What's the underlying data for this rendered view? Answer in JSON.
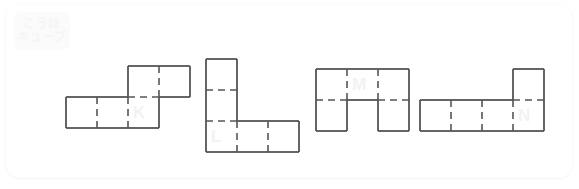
{
  "page": {
    "background_color": "#ffffff",
    "card_color": "#ffffff",
    "stroke_color": "#555555",
    "label_color": "#f2f2f3"
  },
  "logo": {
    "name": "kouho-cube-logo",
    "line1": "こうほ",
    "line2": "キューブ",
    "background": "#fbfbfc",
    "text_color": "#f4f5f6"
  },
  "nets": [
    {
      "label": "K",
      "description": "L-shaped pentomino net: bottom row of three squares with two squares above the rightmost two columns",
      "cell_size": 31,
      "origin_x": 66,
      "origin_y": 66,
      "cells": [
        {
          "col": 0,
          "row": 1
        },
        {
          "col": 1,
          "row": 1
        },
        {
          "col": 2,
          "row": 1
        },
        {
          "col": 2,
          "row": 0
        },
        {
          "col": 3,
          "row": 0
        }
      ],
      "label_col": 2,
      "label_row": 1
    },
    {
      "label": "L",
      "description": "L-shaped pentomino net: vertical column of three squares with two squares extending right from the bottom",
      "cell_size": 31,
      "origin_x": 206,
      "origin_y": 59,
      "cells": [
        {
          "col": 0,
          "row": 0
        },
        {
          "col": 0,
          "row": 1
        },
        {
          "col": 0,
          "row": 2
        },
        {
          "col": 1,
          "row": 2
        },
        {
          "col": 2,
          "row": 2
        }
      ],
      "label_col": 0,
      "label_row": 2
    },
    {
      "label": "M",
      "description": "U-shaped pentomino net: top row of three squares with squares below the left and right columns",
      "cell_size": 31,
      "origin_x": 316,
      "origin_y": 69,
      "cells": [
        {
          "col": 0,
          "row": 0
        },
        {
          "col": 1,
          "row": 0
        },
        {
          "col": 2,
          "row": 0
        },
        {
          "col": 0,
          "row": 1
        },
        {
          "col": 2,
          "row": 1
        }
      ],
      "label_col": 1,
      "label_row": 0
    },
    {
      "label": "N",
      "description": "L-shaped pentomino net: bottom row of four squares with one square above the rightmost column",
      "cell_size": 31,
      "origin_x": 420,
      "origin_y": 69,
      "cells": [
        {
          "col": 0,
          "row": 1
        },
        {
          "col": 1,
          "row": 1
        },
        {
          "col": 2,
          "row": 1
        },
        {
          "col": 3,
          "row": 1
        },
        {
          "col": 3,
          "row": 0
        }
      ],
      "label_col": 3,
      "label_row": 1
    }
  ]
}
